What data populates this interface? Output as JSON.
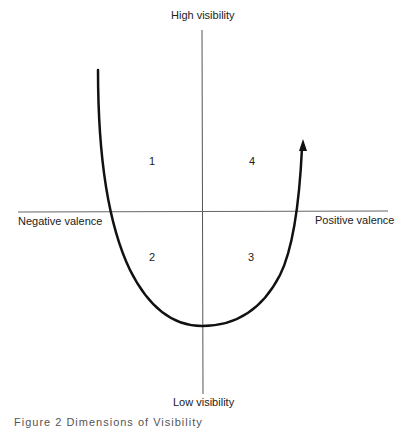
{
  "diagram": {
    "axes": {
      "top_label": "High visibility",
      "bottom_label": "Low visibility",
      "left_label": "Negative valence",
      "right_label": "Positive valence"
    },
    "quadrants": [
      {
        "id": "q1",
        "label": "1",
        "position": "upper-left"
      },
      {
        "id": "q4",
        "label": "4",
        "position": "upper-right"
      },
      {
        "id": "q2",
        "label": "2",
        "position": "lower-left"
      },
      {
        "id": "q3",
        "label": "3",
        "position": "lower-right"
      }
    ],
    "curve": {
      "shape": "U-shaped curve with arrow at upper-right end",
      "color": "#111111"
    },
    "axis_color": "#555555",
    "caption": "Figure 2  Dimensions of Visibility"
  }
}
